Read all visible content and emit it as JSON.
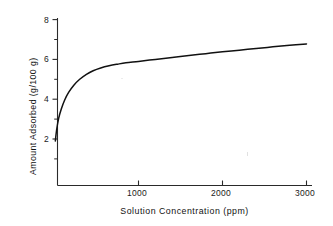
{
  "chart_data": {
    "type": "line",
    "title": "",
    "xlabel": "Solution Concentration (ppm)",
    "ylabel": "Amount Adsorbed (g/100 g)",
    "xlim": [
      0,
      3100
    ],
    "ylim": [
      0,
      8.35
    ],
    "grid": false,
    "legend": null,
    "x_ticks_major": [
      1000,
      2000,
      3000
    ],
    "x_tick_labels": [
      "1000",
      "2000",
      "3000"
    ],
    "y_ticks_major": [
      2,
      4,
      6,
      8
    ],
    "y_tick_labels": [
      "2",
      "4",
      "6",
      "8"
    ],
    "y_ticks_minor": [
      1,
      3,
      5,
      7
    ],
    "line_color": "#111111",
    "series": [
      {
        "name": "adsorption isotherm",
        "x": [
          10,
          25,
          50,
          80,
          120,
          170,
          230,
          300,
          380,
          460,
          550,
          650,
          750,
          850,
          1000,
          1200,
          1400,
          1600,
          1800,
          2000,
          2200,
          2400,
          2600,
          2800,
          3000
        ],
        "y": [
          1.9,
          2.45,
          3.05,
          3.5,
          3.95,
          4.35,
          4.7,
          5.0,
          5.25,
          5.43,
          5.57,
          5.68,
          5.76,
          5.83,
          5.9,
          6.0,
          6.1,
          6.2,
          6.29,
          6.38,
          6.46,
          6.55,
          6.63,
          6.71,
          6.78
        ]
      }
    ]
  },
  "axis": {
    "x_tick_labels": [
      "1000",
      "2000",
      "3000"
    ],
    "y_tick_labels": [
      "8",
      "6",
      "4",
      "2"
    ],
    "x_axis_title": "Solution Concentration (ppm)",
    "y_axis_title": "Amount Adsorbed (g/100 g)"
  }
}
